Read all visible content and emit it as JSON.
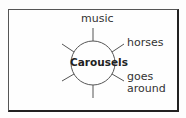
{
  "diagram": {
    "center": "Carousels",
    "spokes": [
      {
        "label": "music"
      },
      {
        "label": "horses"
      },
      {
        "label": "goes"
      },
      {
        "label": "around"
      }
    ]
  }
}
